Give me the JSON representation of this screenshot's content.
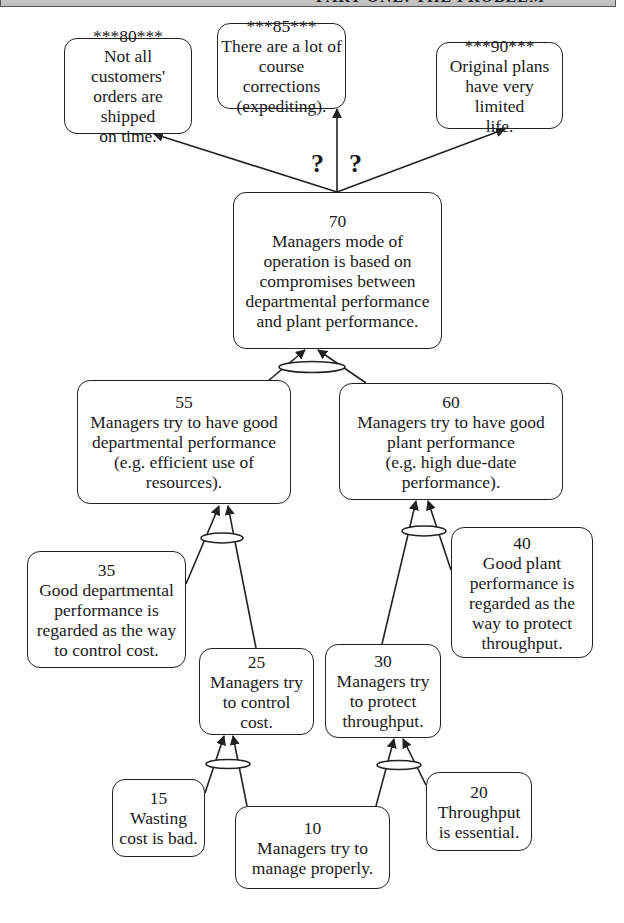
{
  "header": {
    "title": "PART ONE: THE PROBLEM"
  },
  "entities": [
    {
      "id": "80",
      "label": "***80***",
      "text": "Not all customers'\norders are shipped\non time."
    },
    {
      "id": "85",
      "label": "***85***",
      "text": "There are a lot of\ncourse corrections\n(expediting)."
    },
    {
      "id": "90",
      "label": "***90***",
      "text": "Original plans\nhave very limited\nlife."
    },
    {
      "id": "70",
      "label": "70",
      "text": "Managers mode of\noperation is based on\ncompromises between\ndepartmental performance\nand plant performance."
    },
    {
      "id": "55",
      "label": "55",
      "text": "Managers try to have good\ndepartmental performance\n(e.g. efficient use of\nresources)."
    },
    {
      "id": "60",
      "label": "60",
      "text": "Managers try to have good\nplant performance\n(e.g. high due-date\nperformance)."
    },
    {
      "id": "35",
      "label": "35",
      "text": "Good departmental\nperformance is\nregarded as the way\nto control cost."
    },
    {
      "id": "40",
      "label": "40",
      "text": "Good plant\nperformance is\nregarded as the\nway to protect\nthroughput."
    },
    {
      "id": "25",
      "label": "25",
      "text": "Managers try\nto control\ncost."
    },
    {
      "id": "30",
      "label": "30",
      "text": "Managers try\nto protect\nthroughput."
    },
    {
      "id": "15",
      "label": "15",
      "text": "Wasting\ncost is bad."
    },
    {
      "id": "20",
      "label": "20",
      "text": "Throughput\nis essential."
    },
    {
      "id": "10",
      "label": "10",
      "text": "Managers try to\nmanage properly."
    }
  ],
  "annotations": {
    "question_left": "?",
    "question_right": "?"
  },
  "relations": [
    {
      "from": [
        "70"
      ],
      "to": "80",
      "uncertain": true
    },
    {
      "from": [
        "70"
      ],
      "to": "85",
      "uncertain": true
    },
    {
      "from": [
        "70"
      ],
      "to": "90",
      "uncertain": false
    },
    {
      "from": [
        "55",
        "60"
      ],
      "to": "70",
      "and": true
    },
    {
      "from": [
        "35",
        "25"
      ],
      "to": "55",
      "and": true
    },
    {
      "from": [
        "30",
        "40"
      ],
      "to": "60",
      "and": true
    },
    {
      "from": [
        "15",
        "10"
      ],
      "to": "25",
      "and": true
    },
    {
      "from": [
        "10",
        "20"
      ],
      "to": "30",
      "and": true
    }
  ],
  "colors": {
    "line": "#222222",
    "box_fill": "#ffffff",
    "header_fill": "#c8c8c8"
  }
}
